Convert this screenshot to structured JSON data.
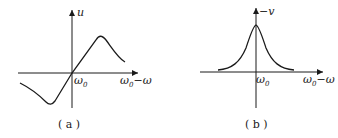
{
  "figure": {
    "panels": [
      {
        "id": "a",
        "caption": "( a )",
        "y_axis_label": "u",
        "origin_label": "ω",
        "origin_label_sub": "0",
        "x_axis_label_main": "ω",
        "x_axis_label_sub": "0",
        "x_axis_label_tail": "−ω",
        "curve": "dispersion (odd) curve: trough left of origin, peak right of origin"
      },
      {
        "id": "b",
        "caption": "( b )",
        "y_axis_label": "−v",
        "origin_label": "ω",
        "origin_label_sub": "0",
        "x_axis_label_main": "ω",
        "x_axis_label_sub": "0",
        "x_axis_label_tail": "−ω",
        "curve": "absorption (even, Lorentzian) curve with peak at origin"
      }
    ],
    "colors": {
      "ink": "#1a1a1a",
      "background": "#ffffff"
    }
  }
}
